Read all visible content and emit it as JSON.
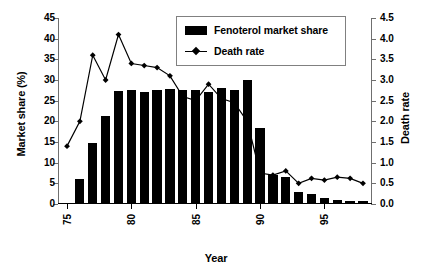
{
  "chart_data": {
    "type": "bar",
    "title": "",
    "xlabel": "Year",
    "ylabel": "Market share (%)",
    "ylabel_secondary": "Death rate",
    "grid": false,
    "legend_position": "top-center",
    "xlim": [
      74.3,
      98.7
    ],
    "ylim": [
      0,
      45
    ],
    "ylim_secondary": [
      0,
      4.5
    ],
    "xticks": [
      75,
      80,
      85,
      90,
      95
    ],
    "xticklabels": [
      "75",
      "80",
      "85",
      "90",
      "95"
    ],
    "yticks": [
      0,
      5,
      10,
      15,
      20,
      25,
      30,
      35,
      40,
      45
    ],
    "yticklabels": [
      "0",
      "5",
      "10",
      "15",
      "20",
      "25",
      "30",
      "35",
      "40",
      "45"
    ],
    "yticks_secondary": [
      0.0,
      0.5,
      1.0,
      1.5,
      2.0,
      2.5,
      3.0,
      3.5,
      4.0,
      4.5
    ],
    "yticklabels_secondary": [
      "0.0",
      "0.5",
      "1.0",
      "1.5",
      "2.0",
      "2.5",
      "3.0",
      "3.5",
      "4.0",
      "4.5"
    ],
    "categories": [
      75,
      76,
      77,
      78,
      79,
      80,
      81,
      82,
      83,
      84,
      85,
      86,
      87,
      88,
      89,
      90,
      91,
      92,
      93,
      94,
      95,
      96,
      97,
      98
    ],
    "series": [
      {
        "name": "Fenoterol market share",
        "axis": "left",
        "render": "bar",
        "color": "#000000",
        "values": [
          0,
          6.0,
          14.7,
          21.2,
          27.4,
          27.7,
          27.2,
          27.6,
          27.8,
          27.6,
          27.5,
          27.2,
          28.0,
          27.5,
          30.0,
          18.5,
          7.0,
          6.5,
          3.0,
          2.5,
          1.5,
          1.0,
          0.8,
          0.7
        ]
      },
      {
        "name": "Death rate",
        "axis": "right",
        "render": "line",
        "color": "#000000",
        "marker": "diamond",
        "values": [
          1.4,
          2.0,
          3.6,
          3.0,
          4.1,
          3.4,
          3.35,
          3.3,
          3.1,
          2.6,
          2.5,
          2.9,
          2.55,
          2.45,
          2.0,
          0.75,
          0.7,
          0.8,
          0.5,
          0.62,
          0.58,
          0.65,
          0.62,
          0.5
        ]
      }
    ]
  },
  "legend": {
    "entries": [
      {
        "label": "Fenoterol market share",
        "marker": "bar-swatch"
      },
      {
        "label": "Death rate",
        "marker": "line-diamond"
      }
    ]
  }
}
